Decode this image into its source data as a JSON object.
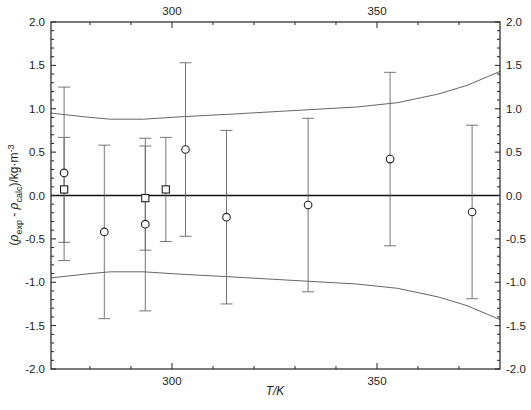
{
  "chart_data": {
    "type": "scatter",
    "title": "",
    "xlabel": "T/K",
    "ylabel": "(ρ_exp - ρ_calc)/kg·m-3",
    "ylabel_parts": {
      "open": "(",
      "rho1": "ρ",
      "sub1": "exp",
      "minus": " - ",
      "rho2": "ρ",
      "sub2": "calc",
      "unit": ")/kg·m",
      "sup": "-3"
    },
    "xlim": [
      270.5,
      380
    ],
    "ylim": [
      -2.0,
      2.0
    ],
    "x_ticks_major": [
      300,
      350
    ],
    "x_ticks_minor": [
      280,
      290,
      310,
      320,
      330,
      340,
      360,
      370
    ],
    "x_tick_labels": [
      "300",
      "350"
    ],
    "y_ticks": [
      -2.0,
      -1.5,
      -1.0,
      -0.5,
      0.0,
      0.5,
      1.0,
      1.5,
      2.0
    ],
    "y_tick_labels": [
      "-2.0",
      "-1.5",
      "-1.0",
      "-0.5",
      "0.0",
      "0.5",
      "1.0",
      "1.5",
      "2.0"
    ],
    "grid": false,
    "legend": null,
    "mirror_axes": true,
    "zero_line": true,
    "series": [
      {
        "name": "circles",
        "marker": "open-circle",
        "points": [
          {
            "x": 273.7,
            "y": 0.26,
            "err_hi": 1.25,
            "err_lo": -0.75
          },
          {
            "x": 283.5,
            "y": -0.42,
            "err_hi": 0.58,
            "err_lo": -1.42
          },
          {
            "x": 293.5,
            "y": -0.33,
            "err_hi": 0.57,
            "err_lo": -1.33
          },
          {
            "x": 303.3,
            "y": 0.53,
            "err_hi": 1.53,
            "err_lo": -0.47
          },
          {
            "x": 313.3,
            "y": -0.25,
            "err_hi": 0.75,
            "err_lo": -1.25
          },
          {
            "x": 333.2,
            "y": -0.11,
            "err_hi": 0.89,
            "err_lo": -1.11
          },
          {
            "x": 353.2,
            "y": 0.42,
            "err_hi": 1.42,
            "err_lo": -0.58
          },
          {
            "x": 373.2,
            "y": -0.19,
            "err_hi": 0.81,
            "err_lo": -1.19
          }
        ]
      },
      {
        "name": "squares",
        "marker": "open-square",
        "points": [
          {
            "x": 273.7,
            "y": 0.07,
            "err_hi": 0.67,
            "err_lo": -0.54
          },
          {
            "x": 293.5,
            "y": -0.03,
            "err_hi": 0.66,
            "err_lo": -0.63
          },
          {
            "x": 298.5,
            "y": 0.07,
            "err_hi": 0.67,
            "err_lo": -0.53
          }
        ]
      },
      {
        "name": "upper-uncertainty",
        "line": true,
        "points": [
          {
            "x": 270.5,
            "y": 0.95
          },
          {
            "x": 280,
            "y": 0.9
          },
          {
            "x": 285,
            "y": 0.88
          },
          {
            "x": 293,
            "y": 0.88
          },
          {
            "x": 303,
            "y": 0.91
          },
          {
            "x": 315,
            "y": 0.94
          },
          {
            "x": 330,
            "y": 0.98
          },
          {
            "x": 345,
            "y": 1.02
          },
          {
            "x": 355,
            "y": 1.07
          },
          {
            "x": 365,
            "y": 1.17
          },
          {
            "x": 372,
            "y": 1.27
          },
          {
            "x": 380,
            "y": 1.43
          }
        ]
      },
      {
        "name": "lower-uncertainty",
        "line": true,
        "points": [
          {
            "x": 270.5,
            "y": -0.95
          },
          {
            "x": 280,
            "y": -0.9
          },
          {
            "x": 285,
            "y": -0.88
          },
          {
            "x": 293,
            "y": -0.88
          },
          {
            "x": 303,
            "y": -0.91
          },
          {
            "x": 315,
            "y": -0.94
          },
          {
            "x": 330,
            "y": -0.98
          },
          {
            "x": 345,
            "y": -1.02
          },
          {
            "x": 355,
            "y": -1.07
          },
          {
            "x": 365,
            "y": -1.17
          },
          {
            "x": 372,
            "y": -1.27
          },
          {
            "x": 380,
            "y": -1.43
          }
        ]
      }
    ]
  }
}
